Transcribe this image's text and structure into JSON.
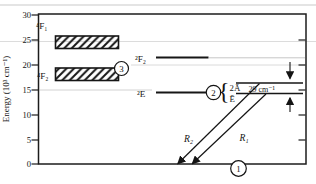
{
  "figure": {
    "y_axis": {
      "label": "Energy (10³ cm⁻¹)",
      "tick_labels": [
        "30",
        "25",
        "20",
        "15",
        "10",
        "5",
        "0"
      ]
    },
    "levels": {
      "f1_band_label": "⁴F₁",
      "f2_band_label": "⁴F₂",
      "f2_doublet_label": "²F₂",
      "e_doublet_label": "²E",
      "two_a_bar_label": "2Ā",
      "e_bar_label": "Ē",
      "splitting_label": "29 cm⁻¹",
      "brace": "{"
    },
    "transitions": {
      "r2_label": "R₂",
      "r1_label": "R₁"
    },
    "markers": {
      "ground_label": "1",
      "metastable_label": "2",
      "pump_band_label": "3"
    }
  },
  "diagram_data": {
    "type": "energy-level-diagram",
    "energy_unit": "10³ cm⁻¹",
    "energy_axis_range": [
      0,
      30
    ],
    "levels": [
      {
        "label": "⁴F₁",
        "kind": "hatched-band",
        "energy_range": [
          23.3,
          25.7
        ]
      },
      {
        "label": "⁴F₂",
        "kind": "hatched-band",
        "energy_range": [
          16.9,
          19.3
        ],
        "marker": "3"
      },
      {
        "label": "²F₂",
        "kind": "line",
        "energy": 21.4
      },
      {
        "label": "²E",
        "kind": "line",
        "energy": 14.3,
        "marker": "2",
        "sublevels": [
          {
            "label": "2Ā"
          },
          {
            "label": "Ē"
          }
        ],
        "sublevel_splitting": "29 cm⁻¹"
      },
      {
        "kind": "baseline",
        "energy": 0,
        "marker": "1"
      }
    ],
    "transitions": [
      {
        "label": "R₂",
        "from": "2Ā",
        "to_energy": 0
      },
      {
        "label": "R₁",
        "from": "Ē",
        "to_energy": 0
      }
    ]
  }
}
